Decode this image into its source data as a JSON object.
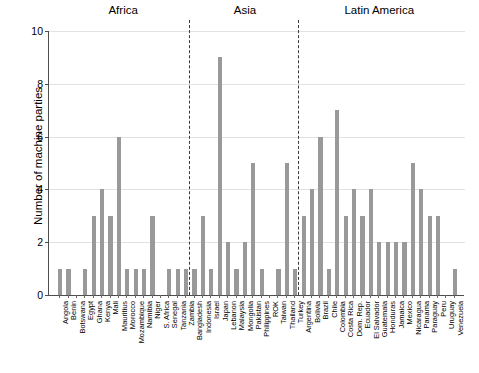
{
  "chart_data": {
    "type": "bar",
    "title": "",
    "xlabel": "",
    "ylabel": "Number of machine parties",
    "ylim": [
      0,
      10
    ],
    "yticks": [
      0,
      2,
      4,
      6,
      8,
      10
    ],
    "grid": true,
    "legend": "none",
    "bar_color": "#999999",
    "groups": [
      {
        "name": "Africa",
        "categories": [
          "Angola",
          "Benin",
          "Botswana",
          "Egypt",
          "Ghana",
          "Kenya",
          "Mali",
          "Mauritius",
          "Morocco",
          "Mozambique",
          "Namibia",
          "Niger",
          "S. Africa",
          "Senegal",
          "Tanzania",
          "Zambia"
        ],
        "values": [
          1,
          1,
          0,
          1,
          3,
          4,
          3,
          6,
          1,
          1,
          1,
          3,
          0,
          1,
          1,
          1
        ]
      },
      {
        "name": "Asia",
        "categories": [
          "Bangladesh",
          "Indonesia",
          "Israel",
          "Japan",
          "Lebanon",
          "Malaysia",
          "Mongolia",
          "Pakistan",
          "Philippines",
          "ROK",
          "Taiwan",
          "Thailand",
          "Turkey"
        ],
        "values": [
          1,
          3,
          1,
          9,
          2,
          1,
          2,
          5,
          1,
          0,
          1,
          5,
          1
        ]
      },
      {
        "name": "Latin America",
        "categories": [
          "Argentina",
          "Bolivia",
          "Brazil",
          "Chile",
          "Colombia",
          "Costa Rica",
          "Dom. Rep.",
          "Ecuador",
          "El Salvador",
          "Guatemala",
          "Honduras",
          "Jamaica",
          "Mexico",
          "Nicaragua",
          "Panama",
          "Paraguay",
          "Peru",
          "Uruguay",
          "Venezuela"
        ],
        "values": [
          3,
          4,
          6,
          1,
          7,
          3,
          4,
          3,
          4,
          2,
          2,
          2,
          2,
          5,
          4,
          3,
          3,
          0,
          1
        ]
      }
    ]
  }
}
